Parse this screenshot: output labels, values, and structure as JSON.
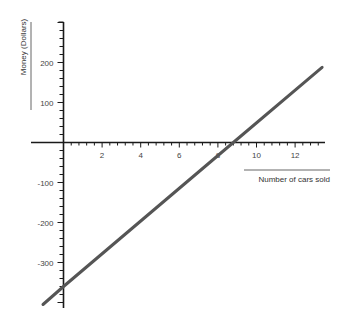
{
  "chart_data": {
    "type": "line",
    "title": "",
    "xlabel": "Number of cars sold",
    "ylabel": "Money (Dollars)",
    "xlim": [
      -1.06,
      13.4
    ],
    "ylim": [
      -410,
      300
    ],
    "x_ticks": [
      2,
      4,
      6,
      8,
      10,
      12
    ],
    "x_tick_labels": [
      "2",
      "4",
      "6",
      "8",
      "10",
      "12"
    ],
    "y_ticks": [
      200,
      100,
      -100,
      -200,
      -300
    ],
    "y_tick_labels": [
      "200",
      "100",
      "-100",
      "-200",
      "-300"
    ],
    "grid": false,
    "legend": null,
    "series": [
      {
        "name": "Profit",
        "color": "#555555",
        "x": [
          -1.06,
          0,
          8.8,
          13.4
        ],
        "y": [
          -405,
          -360,
          0,
          188
        ]
      }
    ],
    "annotations": {
      "y_intercept": -360,
      "x_intercept": 8.8
    }
  },
  "axes": {
    "x_label": "Number of cars sold",
    "y_label": "Money (Dollars)"
  },
  "colors": {
    "axis": "#1a1a1a",
    "line": "#555555",
    "label_rule": "#666666"
  }
}
